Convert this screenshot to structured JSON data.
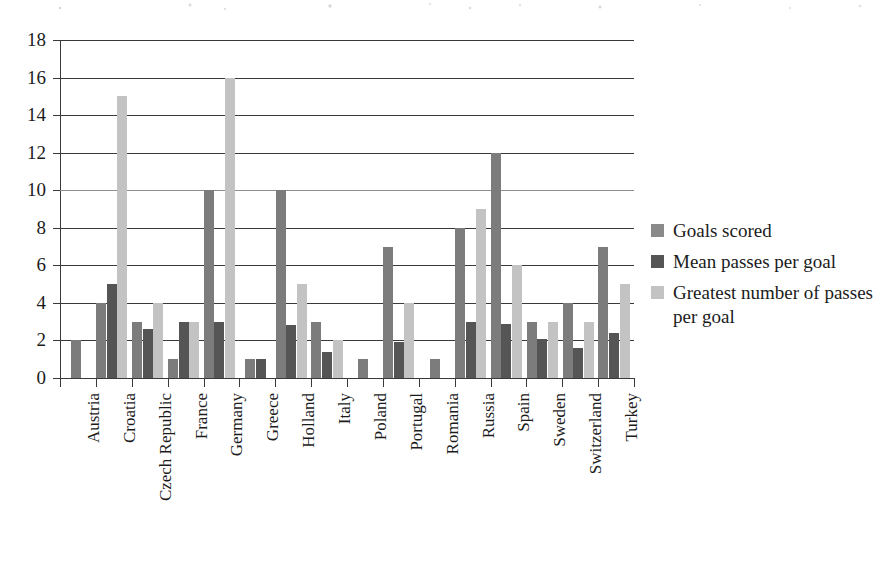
{
  "chart_data": {
    "type": "bar",
    "title": "",
    "subtitle": "",
    "xlabel": "",
    "ylabel": "",
    "ylim": [
      0,
      18
    ],
    "ytick_step": 2,
    "yticks": [
      "0",
      "2",
      "4",
      "6",
      "8",
      "10",
      "12",
      "14",
      "16",
      "18"
    ],
    "grid": true,
    "grid_axis": "y",
    "legend_position": "right",
    "categories": [
      "Austria",
      "Croatia",
      "Czech Republic",
      "France",
      "Germany",
      "Greece",
      "Holland",
      "Italy",
      "Poland",
      "Portugal",
      "Romania",
      "Russia",
      "Spain",
      "Sweden",
      "Switzerland",
      "Turkey"
    ],
    "series": [
      {
        "name": "Goals scored",
        "color": "#7c7c7c",
        "values": [
          2,
          4,
          3,
          1,
          10,
          1,
          10,
          3,
          1,
          7,
          1,
          8,
          12,
          3,
          4,
          7
        ]
      },
      {
        "name": "Mean passes per goal",
        "color": "#555555",
        "values": [
          null,
          5,
          2.6,
          3,
          3,
          1,
          2.8,
          1.4,
          null,
          1.9,
          null,
          3,
          2.9,
          2.1,
          1.6,
          2.4
        ]
      },
      {
        "name": "Greatest number of passes per goal",
        "color": "#c3c3c3",
        "values": [
          null,
          15,
          4,
          3,
          16,
          null,
          5,
          2,
          null,
          4,
          null,
          9,
          6,
          3,
          3,
          5
        ]
      }
    ]
  },
  "legend": {
    "items": [
      {
        "label": "Goals scored",
        "color": "#8a8a8a"
      },
      {
        "label": "Mean passes per goal",
        "color": "#555555"
      },
      {
        "label": "Greatest number of passes per goal",
        "color": "#c3c3c3"
      }
    ]
  },
  "colors": {
    "series_goals": "#7c7c7c",
    "series_mean": "#555555",
    "series_greatest": "#c3c3c3",
    "axis": "#3a3a3a",
    "text": "#1b1b1b",
    "background": "#ffffff"
  }
}
